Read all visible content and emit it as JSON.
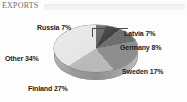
{
  "header": {
    "title": "EXPORTS"
  },
  "footer": {
    "note": ""
  },
  "chart_data": {
    "type": "pie",
    "title": "EXPORTS",
    "subtitle": "",
    "xlabel": "",
    "ylabel": "",
    "legend_position": "none",
    "grid": false,
    "style": "3d-exploded-none-grayscale",
    "categories": [
      "Russia",
      "Latvia",
      "Germany",
      "Sweden",
      "Finland",
      "Other"
    ],
    "values": [
      7,
      7,
      8,
      17,
      27,
      34
    ],
    "unit": "%",
    "slice_colors": [
      "#5f5f5f",
      "#3c3c3c",
      "#6e6e6e",
      "#8e8e8e",
      "#b9b9b9",
      "#e4e4e4"
    ],
    "labels": [
      {
        "name": "Russia",
        "value": 7,
        "text": "Russia 7%",
        "color": "#5f5f5f",
        "leader_line": true
      },
      {
        "name": "Latvia",
        "value": 7,
        "text": "Latvia 7%",
        "color": "#3c3c3c",
        "leader_line": false
      },
      {
        "name": "Germany",
        "value": 8,
        "text": "Germany 8%",
        "color": "#6e6e6e",
        "leader_line": false
      },
      {
        "name": "Sweden",
        "value": 17,
        "text": "Sweden 17%",
        "color": "#8e8e8e",
        "leader_line": false
      },
      {
        "name": "Finland",
        "value": 27,
        "text": "Finland 27%",
        "color": "#b9b9b9",
        "leader_line": false
      },
      {
        "name": "Other",
        "value": 34,
        "text": "Other 34%",
        "color": "#e4e4e4",
        "leader_line": false
      }
    ]
  }
}
